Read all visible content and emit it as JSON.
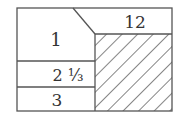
{
  "diagram": {
    "type": "area-partition",
    "stroke_color": "#555555",
    "hatch_color": "#444444",
    "regions": [
      {
        "id": "region-1",
        "label": "1",
        "shape": "pentagon-left-top"
      },
      {
        "id": "region-12",
        "label": "12",
        "shape": "top-right-strip"
      },
      {
        "id": "region-2-1-3",
        "label": "2 ⅓",
        "shape": "left-middle-strip"
      },
      {
        "id": "region-3",
        "label": "3",
        "shape": "left-bottom-strip"
      },
      {
        "id": "region-hatched",
        "label": "",
        "shape": "hatched-rectangle"
      }
    ]
  }
}
